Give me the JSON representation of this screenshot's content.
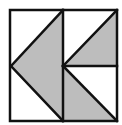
{
  "diagram": {
    "colors": {
      "fill": "#bdbdbd",
      "line": "#111111",
      "background": "#ffffff"
    },
    "shapes": [
      {
        "name": "left-large-triangle",
        "points": "11,66 63,10 63,121",
        "filled": true
      },
      {
        "name": "upper-right-triangle",
        "points": "63,66 117,10 117,66",
        "filled": true
      },
      {
        "name": "lower-right-triangle",
        "points": "63,66 63,121 117,121",
        "filled": true
      }
    ]
  }
}
